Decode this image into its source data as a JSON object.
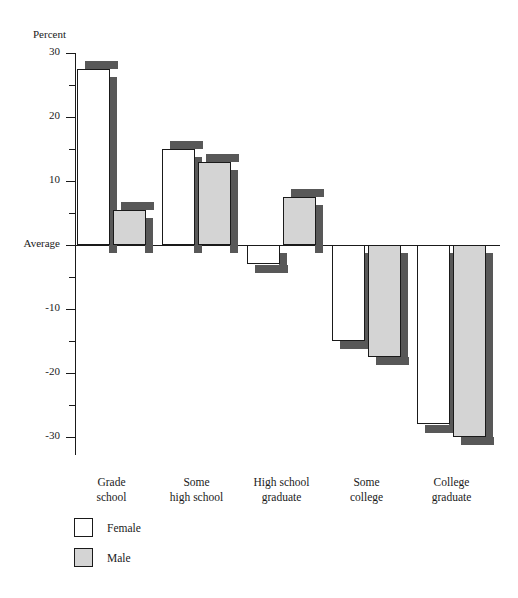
{
  "chart_data": {
    "type": "bar",
    "title": "",
    "subtitle": "",
    "xlabel": "",
    "ylabel": "Percent",
    "categories": [
      "Grade school",
      "Some high school",
      "High school graduate",
      "Some college",
      "College graduate"
    ],
    "category_lines": [
      [
        "Grade",
        "school"
      ],
      [
        "Some",
        "high school"
      ],
      [
        "High school",
        "graduate"
      ],
      [
        "Some",
        "college"
      ],
      [
        "College",
        "graduate"
      ]
    ],
    "series": [
      {
        "name": "Female",
        "color": "#ffffff",
        "values": [
          27.5,
          15,
          -3,
          -15,
          -28
        ]
      },
      {
        "name": "Male",
        "color": "#d4d4d4",
        "values": [
          5.5,
          13,
          7.5,
          -17.5,
          -30
        ]
      }
    ],
    "ylim": [
      -33,
      30
    ],
    "ytick_major": [
      30,
      20,
      10,
      0,
      -10,
      -20,
      -30
    ],
    "ytick_major_labels": [
      "30",
      "20",
      "10",
      "Average",
      "-10",
      "-20",
      "-30"
    ],
    "ytick_minor": [
      25,
      15,
      5,
      -5,
      -15,
      -25
    ],
    "baseline_label": "Average",
    "baseline_value": 0,
    "grid": false,
    "legend_position": "bottom-left",
    "legend_entries": [
      "Female",
      "Male"
    ]
  },
  "axis": {
    "y_title": "Percent"
  }
}
